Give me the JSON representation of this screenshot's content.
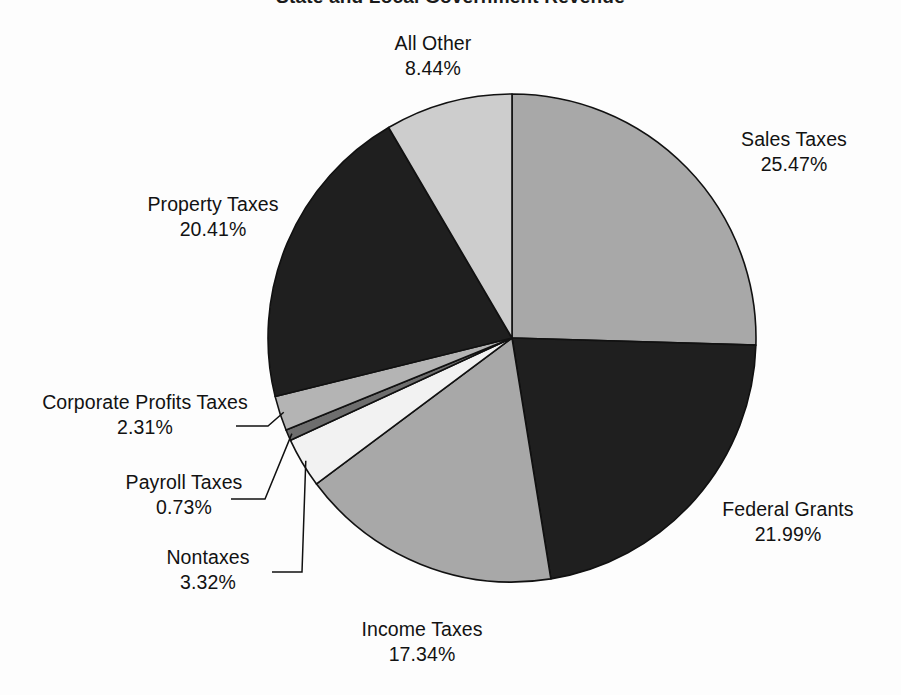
{
  "chart_data": {
    "type": "pie",
    "title": "State and Local Government Revenue",
    "xlabel": "",
    "ylabel": "",
    "legend_position": "none",
    "grid": false,
    "units": "percent",
    "start_angle_oclock": 12,
    "direction": "clockwise",
    "categories": [
      "Sales Taxes",
      "Federal Grants",
      "Income Taxes",
      "Nontaxes",
      "Payroll Taxes",
      "Corporate Profits Taxes",
      "Property Taxes",
      "All Other"
    ],
    "values": [
      25.47,
      21.99,
      17.34,
      3.32,
      0.73,
      2.31,
      20.41,
      8.44
    ],
    "slices": [
      {
        "label": "Sales Taxes",
        "value": 25.47,
        "value_text": "25.47%",
        "color": "#a8a8a8",
        "label_position": "right",
        "leader_line": false
      },
      {
        "label": "Federal Grants",
        "value": 21.99,
        "value_text": "21.99%",
        "color": "#1f1f1f",
        "label_position": "right",
        "leader_line": false
      },
      {
        "label": "Income Taxes",
        "value": 17.34,
        "value_text": "17.34%",
        "color": "#a8a8a8",
        "label_position": "bottom",
        "leader_line": false
      },
      {
        "label": "Nontaxes",
        "value": 3.32,
        "value_text": "3.32%",
        "color": "#f2f2f2",
        "label_position": "left",
        "leader_line": true
      },
      {
        "label": "Payroll Taxes",
        "value": 0.73,
        "value_text": "0.73%",
        "color": "#6e6e6e",
        "label_position": "left",
        "leader_line": true
      },
      {
        "label": "Corporate Profits Taxes",
        "value": 2.31,
        "value_text": "2.31%",
        "color": "#b4b4b4",
        "label_position": "left",
        "leader_line": true
      },
      {
        "label": "Property Taxes",
        "value": 20.41,
        "value_text": "20.41%",
        "color": "#1f1f1f",
        "label_position": "left",
        "leader_line": false
      },
      {
        "label": "All Other",
        "value": 8.44,
        "value_text": "8.44%",
        "color": "#cdcdcd",
        "label_position": "top",
        "leader_line": false
      }
    ],
    "colors": {
      "outline": "#111111",
      "background": "#fdfdfd",
      "text": "#121212"
    }
  }
}
